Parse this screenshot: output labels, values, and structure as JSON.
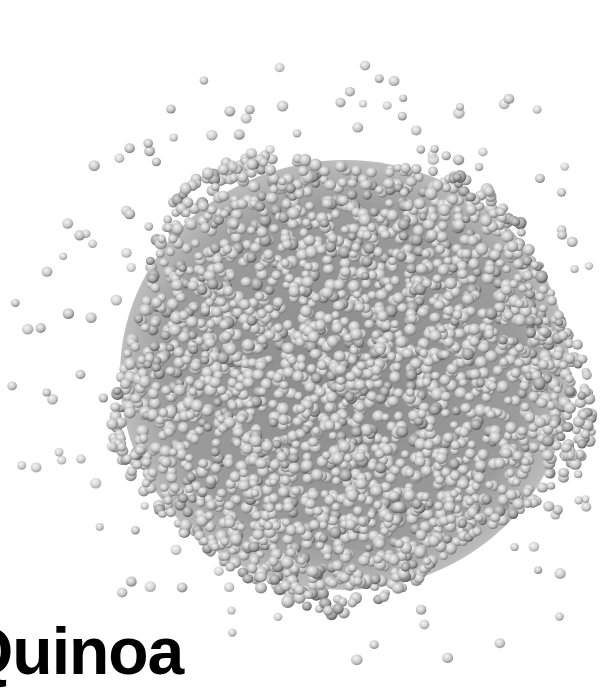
{
  "image": {
    "subject": "Pile of quinoa seeds on white background",
    "caption": "Quinoa",
    "palette": {
      "background": "#ffffff",
      "seed_light": "#e6e6e6",
      "seed_mid": "#b4b4b4",
      "seed_dark": "#5a5a5a",
      "text": "#000000"
    }
  },
  "pile": {
    "center_x": 345,
    "center_y": 375,
    "radius_x": 235,
    "radius_y": 225
  }
}
